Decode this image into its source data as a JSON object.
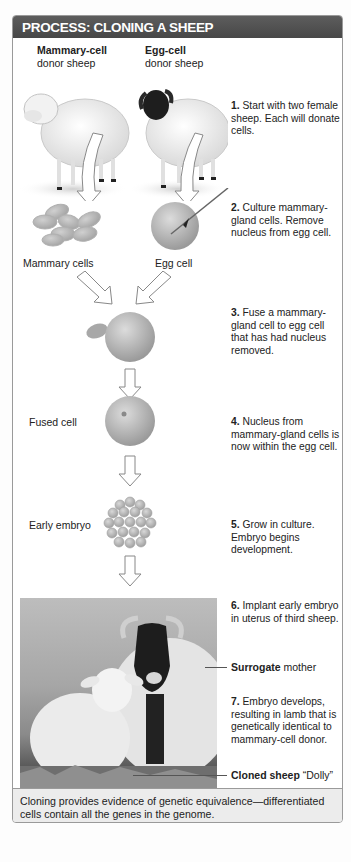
{
  "header": {
    "title": "PROCESS: CLONING A SHEEP"
  },
  "colors": {
    "header_bg": "#4e4e4e",
    "footer_bg": "#ececec",
    "cell": "#b8b8b8",
    "border": "#9a9a9a"
  },
  "donors": {
    "mammary": {
      "bold": "Mammary-cell",
      "rest": "donor sheep"
    },
    "egg": {
      "bold": "Egg-cell",
      "rest": "donor sheep"
    }
  },
  "cell_labels": {
    "mammary_cells": "Mammary cells",
    "egg_cell": "Egg cell",
    "fused_cell": "Fused cell",
    "early_embryo": "Early embryo"
  },
  "steps": [
    {
      "num": "1.",
      "text": " Start with two female sheep. Each will donate cells."
    },
    {
      "num": "2.",
      "text": " Culture mammary-gland cells. Remove nucleus from egg cell."
    },
    {
      "num": "3.",
      "text": " Fuse a mammary-gland cell to egg cell that has had nucleus removed."
    },
    {
      "num": "4.",
      "text": " Nucleus from mammary-gland cells is now within the egg cell."
    },
    {
      "num": "5.",
      "text": " Grow in culture. Embryo begins development."
    },
    {
      "num": "6.",
      "text": " Implant early embryo in uterus of third sheep."
    },
    {
      "num": "7.",
      "text": " Embryo develops, resulting in lamb that is genetically identical to mammary-cell donor."
    }
  ],
  "photo_labels": {
    "surrogate": {
      "bold": "Surrogate",
      "rest": " mother"
    },
    "cloned": {
      "bold": "Cloned sheep",
      "rest": " “Dolly”"
    }
  },
  "footer": {
    "text": "Cloning provides evidence of genetic equivalence—differentiated cells contain all the genes in the genome."
  }
}
